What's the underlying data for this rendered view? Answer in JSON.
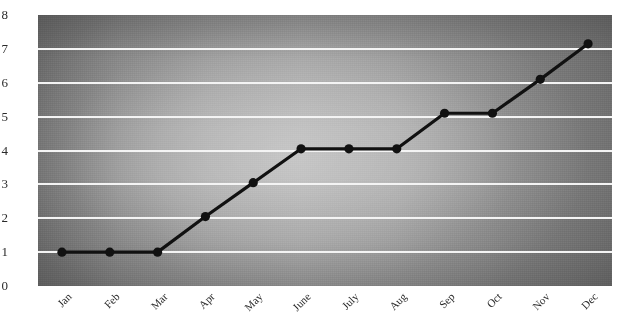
{
  "chart_data": {
    "type": "line",
    "title": "",
    "xlabel": "",
    "ylabel": "",
    "categories": [
      "Jan",
      "Feb",
      "Mar",
      "Apr",
      "May",
      "June",
      "July",
      "Aug",
      "Sep",
      "Oct",
      "Nov",
      "Dec"
    ],
    "values": [
      1.0,
      1.0,
      1.0,
      2.05,
      3.05,
      4.05,
      4.05,
      4.05,
      5.1,
      5.1,
      6.1,
      7.15
    ],
    "series": [
      {
        "name": "",
        "values": [
          1.0,
          1.0,
          1.0,
          2.05,
          3.05,
          4.05,
          4.05,
          4.05,
          5.1,
          5.1,
          6.1,
          7.15
        ]
      }
    ],
    "ylim": [
      0,
      8
    ],
    "yticks": [
      0,
      1,
      2,
      3,
      4,
      5,
      6,
      7,
      8
    ],
    "ytick_labels": [
      "0",
      "1",
      "2",
      "3",
      "4",
      "5",
      "6",
      "7",
      "8"
    ],
    "gridlines": [
      1,
      2,
      3,
      4,
      5,
      6,
      7
    ],
    "grid": true,
    "legend": null,
    "legend_position": "none",
    "annotations": [],
    "line_color": "#111111",
    "marker_color": "#111111",
    "marker_shape": "circle",
    "gridline_color": "#f4f4f4",
    "plot_background": "gray-radial-gradient",
    "axis_label_color": "#2a2a2a",
    "xtick_rotation_degrees": -45
  }
}
